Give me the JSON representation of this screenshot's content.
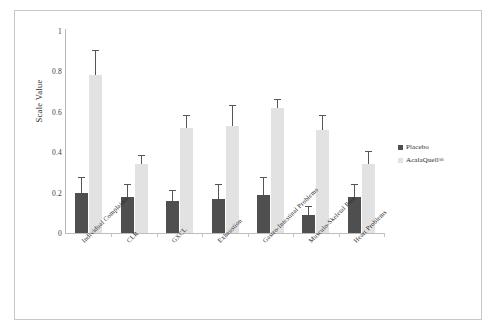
{
  "chart_data": {
    "type": "bar",
    "title": "",
    "xlabel": "",
    "ylabel": "Scale Value",
    "ylim": [
      0,
      1
    ],
    "yticks": [
      "0",
      "0.2",
      "0.4",
      "0.6",
      "0.8",
      "1"
    ],
    "grid": false,
    "legend_position": "right",
    "categories": [
      "Individual Complaints",
      "CLR",
      "GXCL",
      "Exhaustion",
      "Gastro-Intestinal Problems",
      "Musculo-Skeletal Pain",
      "Heart Problems"
    ],
    "series": [
      {
        "name": "Placebo",
        "color": "#4f4f4f",
        "values": [
          0.2,
          0.18,
          0.16,
          0.17,
          0.19,
          0.09,
          0.18
        ],
        "errors": [
          0.07,
          0.06,
          0.05,
          0.07,
          0.08,
          0.04,
          0.06
        ]
      },
      {
        "name": "AcalaQuell®",
        "color": "#e2e2e2",
        "values": [
          0.78,
          0.34,
          0.52,
          0.53,
          0.62,
          0.51,
          0.34
        ],
        "errors": [
          0.12,
          0.04,
          0.06,
          0.1,
          0.04,
          0.07,
          0.06
        ]
      }
    ]
  },
  "legend": {
    "entries": [
      {
        "label": "Placebo",
        "color": "#4f4f4f"
      },
      {
        "label": "AcalaQuell®",
        "color": "#e2e2e2"
      }
    ]
  }
}
